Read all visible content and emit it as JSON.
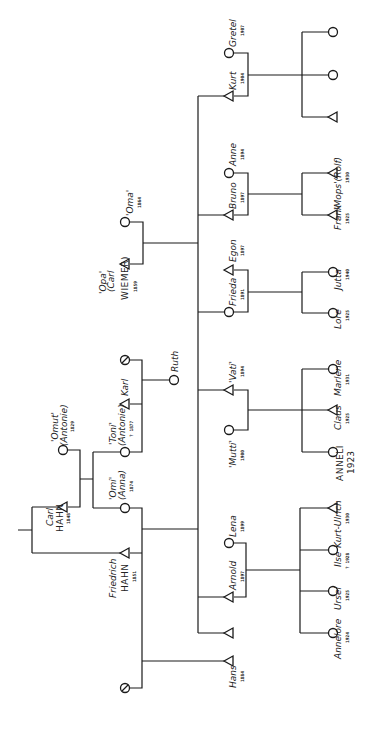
{
  "diagram": {
    "type": "genealogy-tree",
    "orientation": "rotated-90",
    "line_color": "#1a1a1a",
    "people": {
      "carl_hahn": {
        "name": "Carl",
        "surname": "HAHN",
        "year": "1848",
        "sex": "male"
      },
      "friedrich_hahn": {
        "name": "Friedrich",
        "surname": "HAHN",
        "year": "1851",
        "sex": "male"
      },
      "omut": {
        "name": "'Omut'",
        "alias": "(Antonie)",
        "year": "1829",
        "sex": "female"
      },
      "toni": {
        "name": "'Toni'",
        "alias": "(Antonie)",
        "year": "? 1877",
        "sex": "female"
      },
      "omi": {
        "name": "'Omi'",
        "alias": "(Anna)",
        "year": "1874",
        "sex": "female"
      },
      "karl": {
        "name": "Karl",
        "sex": "male"
      },
      "karl_wife": {
        "name": "",
        "sex": "female"
      },
      "ruth": {
        "name": "Ruth",
        "sex": "female"
      },
      "opa": {
        "name": "'Opa'",
        "alias": "(Carl",
        "surname": "WIEMER)",
        "year": "1859",
        "sex": "male"
      },
      "oma": {
        "name": "'Oma'",
        "year": "1864",
        "sex": "female"
      },
      "kurt": {
        "name": "Kurt",
        "year": "1904",
        "sex": "male"
      },
      "gretel": {
        "name": "Gretel",
        "year": "1907",
        "sex": "female"
      },
      "bruno": {
        "name": "Bruno",
        "year": "1897",
        "sex": "male"
      },
      "anne": {
        "name": "Anne",
        "year": "1894",
        "sex": "female"
      },
      "egon": {
        "name": "Egon",
        "year": "1897",
        "sex": "male"
      },
      "frieda": {
        "name": "Frieda",
        "year": "1891",
        "sex": "female"
      },
      "vati": {
        "name": "'Vati'",
        "year": "1894",
        "sex": "male"
      },
      "mutti": {
        "name": "'Mutti'",
        "year": "1900",
        "sex": "female"
      },
      "lena": {
        "name": "Lena",
        "year": "1899",
        "sex": "female"
      },
      "arnold": {
        "name": "Arnold",
        "year": "1897",
        "sex": "male"
      },
      "unnamed_son": {
        "name": "",
        "sex": "male"
      },
      "hans": {
        "name": "Hans",
        "year": "1884",
        "sex": "male"
      },
      "friedrich_wife": {
        "name": "",
        "sex": "female"
      },
      "mops": {
        "name": "'Mops'(Rolf)",
        "year": "1930",
        "sex": "male"
      },
      "frank": {
        "name": "Frank",
        "year": "1925",
        "sex": "male"
      },
      "jutta": {
        "name": "Jutta",
        "year": "1940",
        "sex": "female"
      },
      "lore": {
        "name": "Lore",
        "year": "1925",
        "sex": "female"
      },
      "marlene": {
        "name": "Marlene",
        "year": "1931",
        "sex": "female"
      },
      "claus": {
        "name": "Claus",
        "year": "1925",
        "sex": "male"
      },
      "anneli": {
        "name": "ANNELI",
        "year": "1923",
        "sex": "female"
      },
      "kurt_ulrich": {
        "name": "Kurt-Ulrich",
        "year": "1930",
        "sex": "male"
      },
      "ilse": {
        "name": "Ilse",
        "year": "? 1928",
        "sex": "female"
      },
      "ursel": {
        "name": "Ursel",
        "year": "1925",
        "sex": "female"
      },
      "annelore": {
        "name": "Annelore",
        "year": "1924",
        "sex": "female"
      },
      "kurt_child1": {
        "name": "",
        "sex": "female"
      },
      "kurt_child2": {
        "name": "",
        "sex": "female"
      },
      "kurt_child3": {
        "name": "",
        "sex": "male"
      }
    }
  }
}
